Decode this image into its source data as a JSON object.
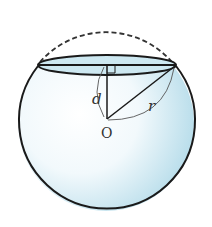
{
  "diagram": {
    "type": "sphere-cross-section",
    "labels": {
      "center": "O",
      "distance": "d",
      "radius": "r"
    },
    "colors": {
      "stroke": "#1a1a1a",
      "fill_light": "#ffffff",
      "fill_blue": "#bfe0ec",
      "section_fill": "#cde8f1",
      "annotation": "#555555"
    }
  }
}
